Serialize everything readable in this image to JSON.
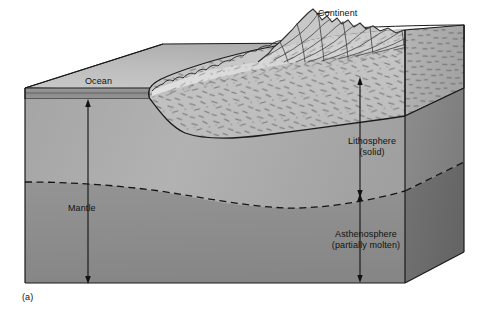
{
  "figure": {
    "panel_label": "(a)",
    "title_text": "",
    "type": "geological-block-diagram"
  },
  "labels": {
    "continent": "Continent",
    "ocean": "Ocean",
    "lithosphere_line1": "Lithosphere",
    "lithosphere_line2": "(solid)",
    "asthenosphere_line1": "Asthenosphere",
    "asthenosphere_line2": "(partially molten)",
    "mantle": "Mantle"
  },
  "colors": {
    "ocean_top_face": "#b9b9b9",
    "ocean_water_band": "#8f8f8f",
    "continent_top_face": "#d8d8d8",
    "continental_crust": "#c2c2c2",
    "lithosphere_mantle": "#a8a8a8",
    "asthenosphere": "#8d8d8d",
    "right_face_litho": "#8a8a8a",
    "right_face_asthen": "#6f6f6f",
    "outline": "#1a1a1a",
    "label_text": "#111111",
    "background": "#ffffff"
  },
  "annotations": [
    {
      "name": "mantle-depth-arrow",
      "style": "double-headed",
      "orientation": "vertical"
    },
    {
      "name": "lithosphere-thickness-arrow",
      "style": "double-headed",
      "orientation": "vertical"
    },
    {
      "name": "asthenosphere-thickness-arrow",
      "style": "double-headed",
      "orientation": "vertical"
    },
    {
      "name": "lithosphere-asthenosphere-boundary",
      "style": "dashed",
      "orientation": "curved"
    }
  ]
}
